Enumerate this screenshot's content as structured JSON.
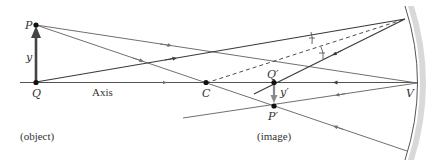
{
  "figure": {
    "type": "concave-mirror-ray-diagram",
    "labels": {
      "P": "P",
      "Q": "Q",
      "y": "y",
      "axis": "Axis",
      "C": "C",
      "Q_prime": "Q′",
      "P_prime": "P′",
      "y_prime": "y′",
      "V": "V",
      "object": "(object)",
      "image": "(image)"
    },
    "points": {
      "P": [
        36,
        25
      ],
      "Q": [
        36,
        82
      ],
      "C": [
        206,
        83
      ],
      "Q_prime": [
        274,
        83
      ],
      "P_prime": [
        274,
        106
      ],
      "V": [
        417,
        83
      ],
      "mirror_top_hit": [
        405,
        19
      ],
      "mirror_bottom_hit": [
        407,
        151
      ]
    },
    "colors": {
      "ray_gray": "#707070",
      "ray_dark": "#3a3a3a",
      "point": "#111111",
      "mirror_edge": "#555555",
      "mirror_fill": "#d9d9d9",
      "object_arrow": "#444444",
      "image_arrow": "#8a8a8a"
    }
  }
}
